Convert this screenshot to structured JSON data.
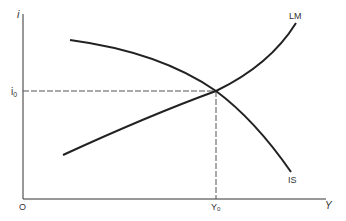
{
  "diagram": {
    "axes": {
      "y_label": "i",
      "x_label": "Y",
      "origin_label": "O"
    },
    "equilibrium": {
      "i_label": "i",
      "i_sub": "0",
      "y_label": "Y",
      "y_sub": "0"
    },
    "curves": [
      {
        "name": "LM",
        "label": "LM",
        "slope": "upward"
      },
      {
        "name": "IS",
        "label": "IS",
        "slope": "downward"
      }
    ],
    "colors": {
      "line": "#222222",
      "dashed": "#555555",
      "text": "#333333"
    }
  }
}
